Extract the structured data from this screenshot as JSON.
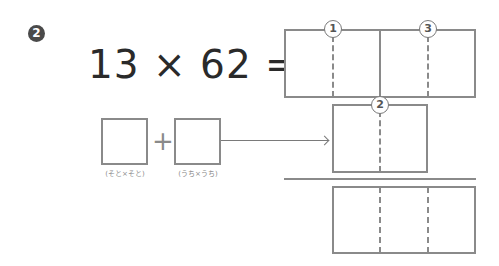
{
  "problem": {
    "number_badge": "2",
    "equation": "13 × 62 =",
    "left_operand": "13",
    "right_operand": "62"
  },
  "answer_box": {
    "markers": [
      {
        "id": "1",
        "label": "1"
      },
      {
        "id": "3",
        "label": "3"
      }
    ]
  },
  "middle_box": {
    "markers": [
      {
        "id": "2",
        "label": "2"
      }
    ]
  },
  "helper": {
    "plus": "+",
    "box1_caption": "(そと×そと)",
    "box2_caption": "(うち×うち)"
  }
}
